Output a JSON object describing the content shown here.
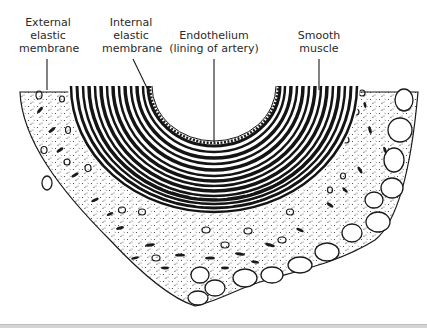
{
  "diagram": {
    "labels": [
      {
        "id": "external-elastic-membrane",
        "lines": [
          "External",
          "elastic",
          "membrane"
        ],
        "x": 48,
        "y": 15,
        "pointer": {
          "x1": 47,
          "y1": 58,
          "x2": 47,
          "y2": 88
        }
      },
      {
        "id": "internal-elastic-membrane",
        "lines": [
          "Internal",
          "elastic",
          "membrane"
        ],
        "x": 131,
        "y": 15,
        "pointer": {
          "x1": 133,
          "y1": 58,
          "x2": 147,
          "y2": 88
        }
      },
      {
        "id": "endothelium",
        "lines": [
          "Endothelium",
          "(lining of artery)"
        ],
        "x": 214,
        "y": 28,
        "pointer": {
          "x1": 214,
          "y1": 58,
          "x2": 214,
          "y2": 141
        }
      },
      {
        "id": "smooth-muscle",
        "lines": [
          "Smooth",
          "muscle"
        ],
        "x": 319,
        "y": 28,
        "pointer": {
          "x1": 319,
          "y1": 58,
          "x2": 319,
          "y2": 88
        }
      }
    ],
    "colors": {
      "ink": "#1a1a1a",
      "label_text": "#2a2a2a",
      "background": "#ffffff",
      "strip": "#d4d4d4"
    }
  }
}
